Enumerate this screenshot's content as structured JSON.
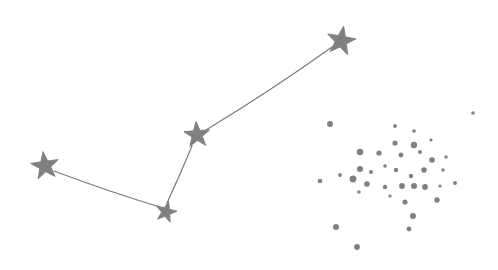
{
  "canvas": {
    "width": 498,
    "height": 270,
    "background": "#ffffff",
    "title": "Constellation with open star cluster"
  },
  "style": {
    "star_fill": "#808080",
    "line_stroke": "#7a7a7a",
    "line_width": 1.2,
    "dot_fill": "#808080"
  },
  "diagram": {
    "named_stars": [
      {
        "id": "star-west",
        "cx": 45,
        "cy": 166,
        "radius": 14.5,
        "rotation": -8
      },
      {
        "id": "star-south",
        "cx": 166,
        "cy": 212,
        "radius": 11.0,
        "rotation": 14
      },
      {
        "id": "star-center",
        "cx": 197,
        "cy": 135,
        "radius": 13.5,
        "rotation": -4
      },
      {
        "id": "star-northeast",
        "cx": 341,
        "cy": 41,
        "radius": 15.0,
        "rotation": 10
      }
    ],
    "links": [
      {
        "id": "link-west-south",
        "from": "star-west",
        "to": "star-south",
        "path": "M 54 171 Q 110 192 160 207"
      },
      {
        "id": "link-south-center",
        "from": "star-south",
        "to": "star-center",
        "path": "M 167 203 Q 180 175 192 146"
      },
      {
        "id": "link-center-northeast",
        "from": "star-center",
        "to": "star-northeast",
        "path": "M 206 130 Q 272 90 332 47"
      }
    ],
    "cluster": {
      "id": "open-cluster",
      "count": 38,
      "dots": [
        {
          "cx": 330,
          "cy": 124,
          "r": 3.0
        },
        {
          "cx": 473,
          "cy": 113,
          "r": 1.8
        },
        {
          "cx": 395,
          "cy": 126,
          "r": 1.9
        },
        {
          "cx": 414,
          "cy": 131,
          "r": 1.8
        },
        {
          "cx": 395,
          "cy": 143,
          "r": 2.6
        },
        {
          "cx": 414,
          "cy": 145,
          "r": 3.2
        },
        {
          "cx": 360,
          "cy": 152,
          "r": 3.2
        },
        {
          "cx": 379,
          "cy": 153,
          "r": 2.6
        },
        {
          "cx": 401,
          "cy": 155,
          "r": 2.4
        },
        {
          "cx": 432,
          "cy": 160,
          "r": 2.8
        },
        {
          "cx": 360,
          "cy": 169,
          "r": 3.0
        },
        {
          "cx": 371,
          "cy": 172,
          "r": 2.0
        },
        {
          "cx": 396,
          "cy": 170,
          "r": 2.2
        },
        {
          "cx": 424,
          "cy": 170,
          "r": 2.8
        },
        {
          "cx": 443,
          "cy": 170,
          "r": 1.7
        },
        {
          "cx": 353,
          "cy": 179,
          "r": 3.4
        },
        {
          "cx": 320,
          "cy": 181,
          "r": 2.3
        },
        {
          "cx": 367,
          "cy": 184,
          "r": 2.8
        },
        {
          "cx": 385,
          "cy": 187,
          "r": 2.2
        },
        {
          "cx": 402,
          "cy": 186,
          "r": 2.9
        },
        {
          "cx": 414,
          "cy": 186,
          "r": 3.0
        },
        {
          "cx": 425,
          "cy": 187,
          "r": 2.9
        },
        {
          "cx": 440,
          "cy": 186,
          "r": 1.6
        },
        {
          "cx": 411,
          "cy": 176,
          "r": 2.2
        },
        {
          "cx": 455,
          "cy": 183,
          "r": 2.0
        },
        {
          "cx": 359,
          "cy": 192,
          "r": 1.8
        },
        {
          "cx": 405,
          "cy": 202,
          "r": 2.6
        },
        {
          "cx": 437,
          "cy": 200,
          "r": 2.7
        },
        {
          "cx": 413,
          "cy": 216,
          "r": 3.0
        },
        {
          "cx": 336,
          "cy": 227,
          "r": 3.0
        },
        {
          "cx": 409,
          "cy": 229,
          "r": 2.4
        },
        {
          "cx": 357,
          "cy": 247,
          "r": 2.9
        },
        {
          "cx": 431,
          "cy": 140,
          "r": 1.6
        },
        {
          "cx": 420,
          "cy": 152,
          "r": 2.0
        },
        {
          "cx": 385,
          "cy": 166,
          "r": 1.8
        },
        {
          "cx": 340,
          "cy": 175,
          "r": 1.9
        },
        {
          "cx": 446,
          "cy": 157,
          "r": 1.7
        },
        {
          "cx": 390,
          "cy": 196,
          "r": 1.6
        }
      ]
    }
  }
}
